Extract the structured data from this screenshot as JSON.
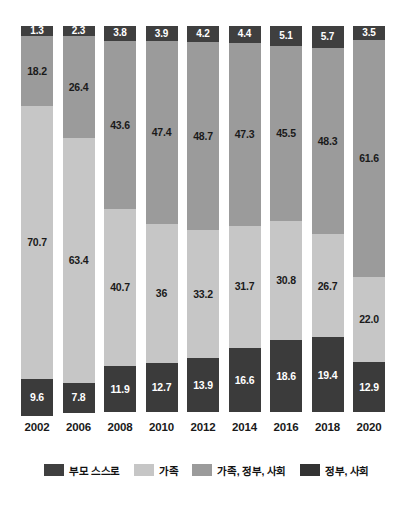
{
  "chart_data": {
    "type": "bar",
    "subtype": "stacked-bar-100-percent",
    "title": "",
    "subtitle": "",
    "xlabel": "",
    "ylabel": "",
    "ylim": [
      0,
      100
    ],
    "grid": false,
    "legend_position": "bottom",
    "categories": [
      "2002",
      "2006",
      "2008",
      "2010",
      "2012",
      "2014",
      "2016",
      "2018",
      "2020"
    ],
    "stack_order_top_to_bottom": [
      "부모 스스로",
      "가족, 정부, 사회",
      "가족",
      "정부, 사회"
    ],
    "series": [
      {
        "name": "부모 스스로",
        "color": "#3f3f3f",
        "values": [
          1.3,
          2.3,
          3.8,
          3.9,
          4.2,
          4.4,
          5.1,
          5.7,
          3.5
        ],
        "labels": [
          "1.3",
          "2.3",
          "3.8",
          "3.9",
          "4.2",
          "4.4",
          "5.1",
          "5.7",
          "3.5"
        ]
      },
      {
        "name": "가족, 정부, 사회",
        "color": "#9b9b9b",
        "values": [
          18.2,
          26.4,
          43.6,
          47.4,
          48.7,
          47.3,
          45.5,
          48.3,
          61.6
        ],
        "labels": [
          "18.2",
          "26.4",
          "43.6",
          "47.4",
          "48.7",
          "47.3",
          "45.5",
          "48.3",
          "61.6"
        ]
      },
      {
        "name": "가족",
        "color": "#c6c6c6",
        "values": [
          70.7,
          63.4,
          40.7,
          36,
          33.2,
          31.7,
          30.8,
          26.7,
          22.0
        ],
        "labels": [
          "70.7",
          "63.4",
          "40.7",
          "36",
          "33.2",
          "31.7",
          "30.8",
          "26.7",
          "22.0"
        ]
      },
      {
        "name": "정부, 사회",
        "color": "#3b3b3b",
        "values": [
          9.6,
          7.8,
          11.9,
          12.7,
          13.9,
          16.6,
          18.6,
          19.4,
          12.9
        ],
        "labels": [
          "9.6",
          "7.8",
          "11.9",
          "12.7",
          "13.9",
          "16.6",
          "18.6",
          "19.4",
          "12.9"
        ]
      }
    ]
  },
  "legend": {
    "items": [
      {
        "label": "부모 스스로",
        "swatch": "s-self"
      },
      {
        "label": "가족",
        "swatch": "s-family"
      },
      {
        "label": "가족, 정부, 사회",
        "swatch": "s-mixed"
      },
      {
        "label": "정부, 사회",
        "swatch": "s-govt"
      }
    ]
  },
  "colors": {
    "self": "#3f3f3f",
    "family": "#c6c6c6",
    "mixed": "#9b9b9b",
    "govt": "#3b3b3b",
    "background": "#ffffff",
    "text": "#111111"
  }
}
